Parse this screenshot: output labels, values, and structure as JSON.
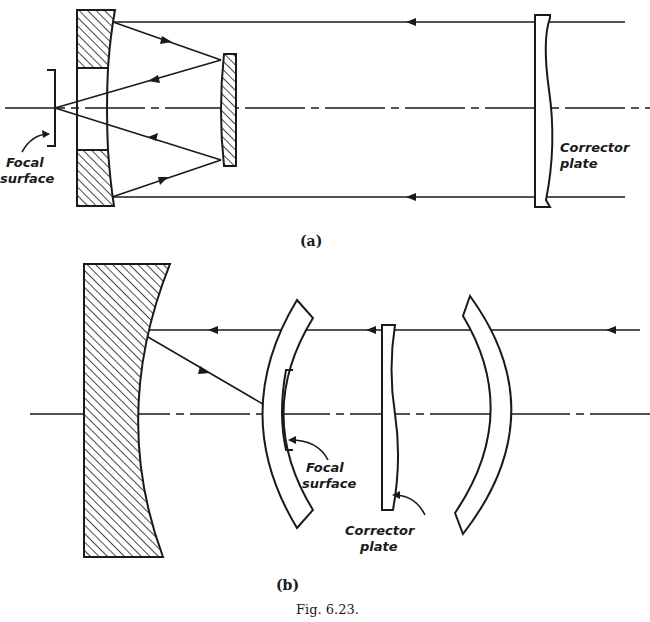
{
  "figure": {
    "caption": "Fig. 6.23.",
    "ink_color": "#1a1a1a",
    "background": "#ffffff"
  },
  "panel_a": {
    "label": "(a)",
    "focal_surface_label_line1": "Focal",
    "focal_surface_label_line2": "surface",
    "corrector_label_line1": "Corrector",
    "corrector_label_line2": "plate",
    "components": [
      "perforated primary mirror",
      "convex secondary mirror",
      "corrector plate",
      "focal surface"
    ]
  },
  "panel_b": {
    "label": "(b)",
    "focal_surface_label_line1": "Focal",
    "focal_surface_label_line2": "surface",
    "corrector_label_line1": "Corrector",
    "corrector_label_line2": "plate",
    "components": [
      "concave spherical mirror",
      "inner meniscus shell",
      "corrector plate",
      "outer meniscus shell",
      "curved focal surface"
    ]
  }
}
